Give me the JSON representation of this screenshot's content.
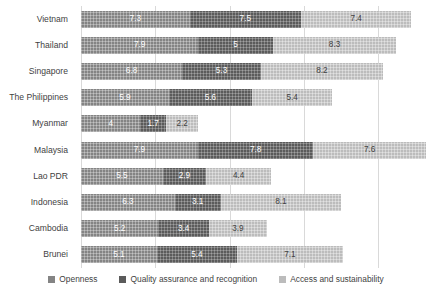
{
  "chart_data": {
    "type": "bar",
    "orientation": "horizontal",
    "stacked": true,
    "title": "",
    "subtitle": "",
    "xlabel": "",
    "ylabel": "",
    "xlim": [
      0,
      23.2
    ],
    "grid": true,
    "gridline_values": [
      0,
      5,
      10,
      15,
      20
    ],
    "legend_position": "bottom",
    "categories": [
      "Vietnam",
      "Thailand",
      "Singapore",
      "The Philippines",
      "Myanmar",
      "Malaysia",
      "Lao PDR",
      "Indonesia",
      "Cambodia",
      "Brunei"
    ],
    "series": [
      {
        "name": "Openness",
        "color": "#848484",
        "values": [
          7.3,
          7.9,
          6.8,
          5.9,
          4,
          7.9,
          5.5,
          6.3,
          5.2,
          5.1
        ],
        "labels": [
          "7.3",
          "7.9",
          "6.8",
          "5.9",
          "4",
          "7.9",
          "5.5",
          "6.3",
          "5.2",
          "5.1"
        ]
      },
      {
        "name": "Quality assurance and recognition",
        "color": "#5b5b5b",
        "values": [
          7.5,
          5,
          5.3,
          5.6,
          1.7,
          7.8,
          2.9,
          3.1,
          3.4,
          5.4
        ],
        "labels": [
          "7.5",
          "5",
          "5.3",
          "5.6",
          "1.7",
          "7.8",
          "2.9",
          "3.1",
          "3.4",
          "5.4"
        ]
      },
      {
        "name": "Access and sustainability",
        "color": "#bcbcbc",
        "values": [
          7.4,
          8.3,
          8.2,
          5.4,
          2.2,
          7.6,
          4.4,
          8.1,
          3.9,
          7.1
        ],
        "labels": [
          "7.4",
          "8.3",
          "8.2",
          "5.4",
          "2.2",
          "7.6",
          "4.4",
          "8.1",
          "3.9",
          "7.1"
        ]
      }
    ]
  },
  "legend": {
    "items": [
      {
        "label": "Openness"
      },
      {
        "label": "Quality assurance and recognition"
      },
      {
        "label": "Access and sustainability"
      }
    ]
  }
}
